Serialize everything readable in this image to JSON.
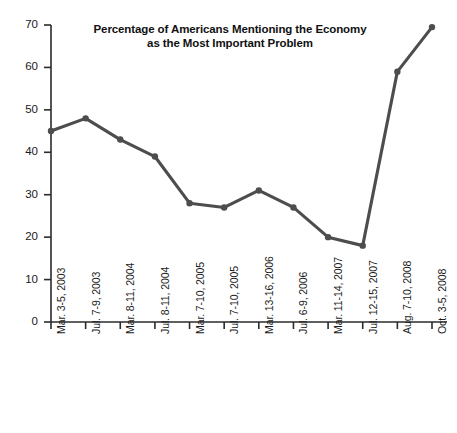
{
  "chart_data": {
    "type": "line",
    "title": "Percentage of Americans Mentioning the Economy as the Most Important Problem",
    "title_line1": "Percentage of Americans Mentioning the Economy",
    "title_line2": "as the Most Important Problem",
    "xlabel": "",
    "ylabel": "",
    "ylim": [
      0,
      70
    ],
    "y_ticks": [
      0,
      10,
      20,
      30,
      40,
      50,
      60,
      70
    ],
    "grid": false,
    "legend": null,
    "series_color": "#4d4d4d",
    "categories": [
      "Mar. 3-5, 2003",
      "Jul. 7-9, 2003",
      "Mar. 8-11, 2004",
      "Jul. 8-11, 2004",
      "Mar. 7-10, 2005",
      "Jul. 7-10, 2005",
      "Mar. 13-16, 2006",
      "Jul. 6-9, 2006",
      "Mar. 11-14, 2007",
      "Jul. 12-15, 2007",
      "Aug. 7-10, 2008",
      "Oct. 3-5, 2008"
    ],
    "values": [
      45,
      48,
      43,
      39,
      28,
      27,
      31,
      27,
      20,
      18,
      59,
      69.5
    ]
  }
}
